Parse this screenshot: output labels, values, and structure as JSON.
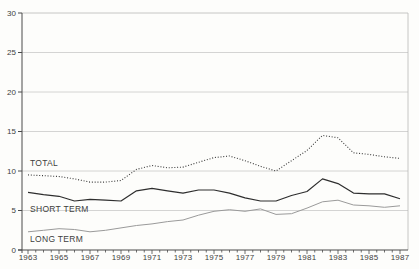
{
  "figure": {
    "background": "#fdfdfb",
    "text_color": "#3d3d3d",
    "grid_color": "#c9c9c9",
    "frame_color": "#b8b8b8",
    "axis_color": "#4a4a4a"
  },
  "chart_data": {
    "type": "line",
    "title": "",
    "xlabel": "",
    "ylabel": "",
    "x": [
      1963,
      1964,
      1965,
      1966,
      1967,
      1968,
      1969,
      1970,
      1971,
      1972,
      1973,
      1974,
      1975,
      1976,
      1977,
      1978,
      1979,
      1980,
      1981,
      1982,
      1983,
      1984,
      1985,
      1986,
      1987
    ],
    "x_label_years": [
      1963,
      1965,
      1967,
      1969,
      1971,
      1973,
      1975,
      1977,
      1979,
      1981,
      1983,
      1985,
      1987
    ],
    "x_tick_step": 0.5,
    "ylim": [
      0,
      30
    ],
    "yticks": [
      0,
      5,
      10,
      15,
      20,
      25,
      30
    ],
    "grid": "horizontal",
    "legend_position": "inline-labels",
    "series": [
      {
        "name": "TOTAL",
        "line_style": "dotted",
        "color": "#3b3b3b",
        "values": [
          9.5,
          9.4,
          9.3,
          9.0,
          8.6,
          8.6,
          8.8,
          10.2,
          10.7,
          10.4,
          10.5,
          11.1,
          11.7,
          11.9,
          11.3,
          10.6,
          10.0,
          11.3,
          12.6,
          14.5,
          14.2,
          12.3,
          12.1,
          11.8,
          11.6
        ]
      },
      {
        "name": "SHORT TERM",
        "line_style": "solid",
        "color": "#2e2e2e",
        "values": [
          7.3,
          7.0,
          6.8,
          6.2,
          6.4,
          6.3,
          6.2,
          7.5,
          7.8,
          7.5,
          7.2,
          7.6,
          7.6,
          7.2,
          6.6,
          6.2,
          6.2,
          6.9,
          7.4,
          9.0,
          8.4,
          7.2,
          7.1,
          7.1,
          6.5
        ]
      },
      {
        "name": "LONG TERM",
        "line_style": "solid",
        "color": "#9a9a9a",
        "values": [
          2.3,
          2.5,
          2.7,
          2.6,
          2.3,
          2.5,
          2.8,
          3.1,
          3.3,
          3.6,
          3.8,
          4.4,
          4.9,
          5.1,
          4.9,
          5.2,
          4.5,
          4.6,
          5.3,
          6.1,
          6.3,
          5.7,
          5.6,
          5.4,
          5.6
        ]
      }
    ]
  }
}
